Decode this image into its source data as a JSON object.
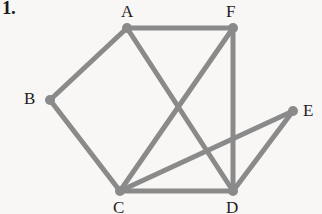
{
  "problem": {
    "number_label": "1."
  },
  "diagram": {
    "type": "undirected-graph",
    "background_color": "#f8f7f5",
    "edge_color": "#8a8a8a",
    "vertex_color": "#8a8a8a",
    "label_color": "#1d1d1d",
    "edge_width": 5,
    "vertex_radius": 5,
    "vertices": [
      {
        "id": "A",
        "label": "A",
        "x": 127,
        "y": 28,
        "label_x": 121,
        "label_y": 3
      },
      {
        "id": "B",
        "label": "B",
        "x": 50,
        "y": 100,
        "label_x": 24,
        "label_y": 90
      },
      {
        "id": "C",
        "label": "C",
        "x": 120,
        "y": 191,
        "label_x": 113,
        "label_y": 199
      },
      {
        "id": "D",
        "label": "D",
        "x": 233,
        "y": 191,
        "label_x": 226,
        "label_y": 199
      },
      {
        "id": "E",
        "label": "E",
        "x": 293,
        "y": 111,
        "label_x": 303,
        "label_y": 102
      },
      {
        "id": "F",
        "label": "F",
        "x": 233,
        "y": 28,
        "label_x": 226,
        "label_y": 3
      }
    ],
    "edges": [
      {
        "from": "A",
        "to": "F"
      },
      {
        "from": "A",
        "to": "B"
      },
      {
        "from": "A",
        "to": "D"
      },
      {
        "from": "B",
        "to": "C"
      },
      {
        "from": "C",
        "to": "F"
      },
      {
        "from": "C",
        "to": "D"
      },
      {
        "from": "C",
        "to": "E"
      },
      {
        "from": "D",
        "to": "F"
      },
      {
        "from": "D",
        "to": "E"
      }
    ]
  }
}
